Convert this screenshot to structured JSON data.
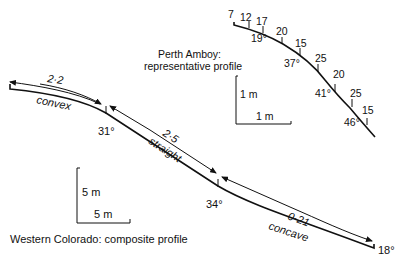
{
  "perth_amboy": {
    "title_line1": "Perth Amboy:",
    "title_line2": "representative profile",
    "segment_lengths": [
      "7",
      "12",
      "17",
      "20",
      "15",
      "25",
      "20",
      "25",
      "15"
    ],
    "angles": [
      "19°",
      "37°",
      "41°",
      "46°"
    ],
    "scale_vertical": "1 m",
    "scale_horizontal": "1 m"
  },
  "western_colorado": {
    "title": "Western Colorado: composite profile",
    "segments": [
      {
        "name": "convex",
        "ratio": "2·2"
      },
      {
        "name": "straight",
        "ratio": "2·5"
      },
      {
        "name": "concave",
        "ratio": "0·21"
      }
    ],
    "angles": [
      "31°",
      "34°",
      "18°"
    ],
    "scale_vertical": "5 m",
    "scale_horizontal": "5 m"
  }
}
